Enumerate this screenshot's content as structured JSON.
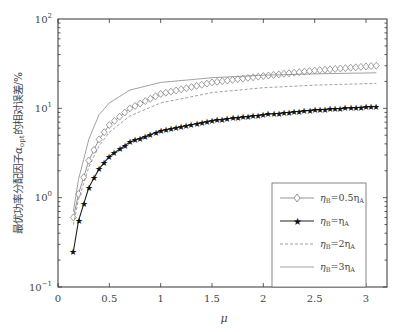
{
  "chart_data": {
    "type": "line",
    "title": "",
    "xlabel": "μ",
    "ylabel": "最优功率分配因子α_opt的相对误差/%",
    "yscale": "log",
    "xlim": [
      0,
      3.2
    ],
    "ylim": [
      0.1,
      100
    ],
    "xticks": [
      "0",
      "0.5",
      "1",
      "1.5",
      "2",
      "2.5",
      "3"
    ],
    "yticks": [
      "10^-1",
      "10^0",
      "10^1",
      "10^2"
    ],
    "grid": false,
    "legend_position": "lower right",
    "x": [
      0.15,
      0.2,
      0.3,
      0.4,
      0.5,
      0.7,
      1.0,
      1.5,
      2.0,
      2.5,
      3.1
    ],
    "series": [
      {
        "name": "ηB=0.5ηA",
        "marker": "diamond",
        "line": "solid-gray",
        "values": [
          0.6,
          1.1,
          2.6,
          4.5,
          6.5,
          10,
          14.5,
          19.5,
          23,
          26.5,
          30
        ]
      },
      {
        "name": "ηB=ηA",
        "marker": "star",
        "line": "solid-black",
        "values": [
          0.25,
          0.55,
          1.3,
          2.1,
          2.9,
          4.2,
          5.6,
          7.3,
          8.5,
          9.6,
          10.5
        ]
      },
      {
        "name": "ηB=2ηA",
        "marker": "none",
        "line": "dashed",
        "values": [
          0.5,
          0.95,
          2.2,
          3.8,
          5.4,
          8.2,
          11.5,
          15,
          17,
          18.2,
          19
        ]
      },
      {
        "name": "ηB=3ηA",
        "marker": "none",
        "line": "solid-thin",
        "values": [
          0.7,
          1.6,
          4.5,
          8.5,
          11.5,
          16,
          19.5,
          22,
          23.5,
          24.3,
          25
        ]
      }
    ]
  },
  "axes": {
    "xlabel": "μ",
    "ylabel_main": "最优功率分配因子",
    "ylabel_sym": "α",
    "ylabel_sub": "opt",
    "ylabel_tail": "的相对误差/%",
    "xticks": [
      "0",
      "0.5",
      "1",
      "1.5",
      "2",
      "2.5",
      "3"
    ],
    "yticks_base": [
      "10",
      "10",
      "10",
      "10"
    ],
    "yticks_exp": [
      "2",
      "1",
      "0",
      "−1"
    ]
  },
  "legend": {
    "items": [
      {
        "pre": "η",
        "sub1": "B",
        "mid": "=0.5η",
        "sub2": "A"
      },
      {
        "pre": "η",
        "sub1": "B",
        "mid": "=η",
        "sub2": "A"
      },
      {
        "pre": "η",
        "sub1": "B",
        "mid": "=2η",
        "sub2": "A"
      },
      {
        "pre": "η",
        "sub1": "B",
        "mid": "=3η",
        "sub2": "A"
      }
    ]
  }
}
